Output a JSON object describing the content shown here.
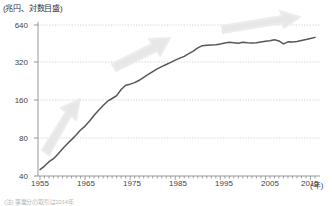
{
  "unit_label": "(兆円、対数目盛)",
  "x_axis_unit": "(年)",
  "footnote": "(注) 事業分の取引は2014年",
  "colors": {
    "line": "#57575a",
    "axis": "#8c8c8c",
    "grid": "#bdbdbd",
    "arrow": "#e2e2e2",
    "text": "#444444"
  },
  "chart_data": {
    "type": "line",
    "title": "",
    "subtitle": "",
    "xlabel": "年",
    "ylabel": "兆円",
    "yscale": "log",
    "ylim": [
      40,
      640
    ],
    "xlim": [
      1955,
      2016
    ],
    "grid": true,
    "legend": null,
    "yticks": [
      640,
      320,
      160,
      80,
      40
    ],
    "xticks": [
      1955,
      1965,
      1975,
      1985,
      1995,
      2005,
      2015
    ],
    "series": [
      {
        "name": "名目GDP",
        "x": [
          1955,
          1956,
          1957,
          1958,
          1959,
          1960,
          1961,
          1962,
          1963,
          1964,
          1965,
          1966,
          1967,
          1968,
          1969,
          1970,
          1971,
          1972,
          1973,
          1974,
          1975,
          1976,
          1977,
          1978,
          1979,
          1980,
          1981,
          1982,
          1983,
          1984,
          1985,
          1986,
          1987,
          1988,
          1989,
          1990,
          1991,
          1992,
          1993,
          1994,
          1995,
          1996,
          1997,
          1998,
          1999,
          2000,
          2001,
          2002,
          2003,
          2004,
          2005,
          2006,
          2007,
          2008,
          2009,
          2010,
          2011,
          2012,
          2013,
          2014,
          2015,
          2016
        ],
        "values": [
          45,
          48,
          52,
          55,
          60,
          66,
          72,
          78,
          85,
          93,
          100,
          110,
          122,
          134,
          146,
          158,
          166,
          175,
          196,
          212,
          216,
          222,
          232,
          245,
          258,
          272,
          286,
          298,
          310,
          322,
          336,
          348,
          360,
          378,
          396,
          420,
          438,
          442,
          444,
          446,
          452,
          460,
          466,
          462,
          458,
          466,
          462,
          460,
          462,
          468,
          474,
          480,
          488,
          478,
          452,
          470,
          468,
          472,
          482,
          490,
          500,
          510
        ],
        "note": "対数目盛。1955年=45兆円から2016年=約510兆円。1974年の石油危機で屈曲、1991年以降は横ばい、2008-09年に落ち込み。"
      }
    ],
    "annotations": [
      {
        "name": "growth-arrow-1",
        "label": "",
        "phase": "高度成長期",
        "x_from": 1957,
        "x_to": 1966,
        "y_from": 72,
        "y_to": 230,
        "angle_deg": -42
      },
      {
        "name": "growth-arrow-2",
        "label": "",
        "phase": "安定成長期",
        "x_from": 1972,
        "x_to": 1986,
        "y_from": 250,
        "y_to": 520,
        "angle_deg": -27
      },
      {
        "name": "growth-arrow-3",
        "label": "",
        "phase": "停滞期",
        "x_from": 1995,
        "x_to": 2016,
        "y_from": 520,
        "y_to": 620,
        "angle_deg": -8
      }
    ]
  }
}
